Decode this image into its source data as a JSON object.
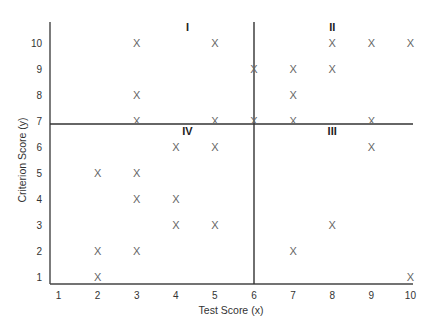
{
  "chart_data": {
    "type": "scatter",
    "title": "",
    "xlabel": "Test Score (x)",
    "ylabel": "Criterion Score (y)",
    "xlim": [
      1,
      10
    ],
    "ylim": [
      1,
      10
    ],
    "x_ticks": [
      "1",
      "2",
      "3",
      "4",
      "5",
      "6",
      "7",
      "8",
      "9",
      "10"
    ],
    "y_ticks": [
      "1",
      "2",
      "3",
      "4",
      "5",
      "6",
      "7",
      "8",
      "9",
      "10"
    ],
    "grid": false,
    "marker": "X",
    "points": [
      {
        "x": 2,
        "y": 5
      },
      {
        "x": 2,
        "y": 2
      },
      {
        "x": 2,
        "y": 1
      },
      {
        "x": 3,
        "y": 10
      },
      {
        "x": 3,
        "y": 8
      },
      {
        "x": 3,
        "y": 7
      },
      {
        "x": 3,
        "y": 5
      },
      {
        "x": 3,
        "y": 4
      },
      {
        "x": 3,
        "y": 2
      },
      {
        "x": 4,
        "y": 6
      },
      {
        "x": 4,
        "y": 4
      },
      {
        "x": 4,
        "y": 3
      },
      {
        "x": 5,
        "y": 10
      },
      {
        "x": 5,
        "y": 7
      },
      {
        "x": 5,
        "y": 6
      },
      {
        "x": 5,
        "y": 3
      },
      {
        "x": 6,
        "y": 9
      },
      {
        "x": 6,
        "y": 7
      },
      {
        "x": 7,
        "y": 9
      },
      {
        "x": 7,
        "y": 8
      },
      {
        "x": 7,
        "y": 7
      },
      {
        "x": 7,
        "y": 2
      },
      {
        "x": 8,
        "y": 10
      },
      {
        "x": 8,
        "y": 9
      },
      {
        "x": 8,
        "y": 3
      },
      {
        "x": 9,
        "y": 10
      },
      {
        "x": 9,
        "y": 7
      },
      {
        "x": 9,
        "y": 6
      },
      {
        "x": 10,
        "y": 10
      },
      {
        "x": 10,
        "y": 1
      }
    ],
    "dividers": {
      "vertical_x": 6,
      "horizontal_y": 6.9
    },
    "quadrant_labels": [
      {
        "label": "I",
        "x": 4.3,
        "y": 10.6
      },
      {
        "label": "II",
        "x": 8,
        "y": 10.6
      },
      {
        "label": "III",
        "x": 8,
        "y": 6.6
      },
      {
        "label": "IV",
        "x": 4.3,
        "y": 6.6
      }
    ]
  }
}
